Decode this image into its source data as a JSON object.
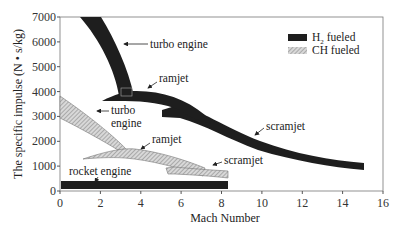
{
  "chart_data": {
    "type": "area",
    "title": "",
    "xlabel": "Mach Number",
    "ylabel": "The specific impulse (N • s/kg)",
    "xlim": [
      0,
      16
    ],
    "ylim": [
      0,
      7000
    ],
    "x_ticks": [
      "0",
      "2",
      "4",
      "6",
      "8",
      "10",
      "12",
      "14",
      "16"
    ],
    "y_ticks": [
      "0",
      "1000",
      "2000",
      "3000",
      "4000",
      "5000",
      "6000",
      "7000"
    ],
    "grid": false,
    "legend_position": "upper right",
    "legend": [
      {
        "label": "H2 fueled",
        "label_main": "H",
        "label_sub": "2",
        "label_rest": " fueled",
        "style": "solid",
        "color": "#1e1e1e"
      },
      {
        "label": "CH fueled",
        "label_main": "CH fueled",
        "style": "hatched",
        "color": "#b5b5b5"
      }
    ],
    "series": [
      {
        "name": "turbo engine",
        "fuel": "H2",
        "x_range": [
          1,
          3.7
        ],
        "isp_upper": [
          7000,
          3800
        ],
        "isp_lower": [
          7000,
          3800
        ],
        "note": "band from Mach ~1-2 at 7000 down to ~3800 near Mach 3-3.7"
      },
      {
        "name": "ramjet",
        "fuel": "H2",
        "x_range": [
          2.1,
          7.5
        ],
        "isp_start": 3600,
        "isp_peak": 4100,
        "isp_end": 2600
      },
      {
        "name": "scramjet",
        "fuel": "H2",
        "x_range": [
          5,
          15
        ],
        "isp_start": [
          3000,
          3400
        ],
        "isp_end": [
          1000,
          1300
        ]
      },
      {
        "name": "turbo engine",
        "fuel": "CH",
        "x_range": [
          0,
          3.6
        ],
        "isp_start": [
          3300,
          4100
        ],
        "isp_end": 1700
      },
      {
        "name": "ramjet",
        "fuel": "CH",
        "x_range": [
          1.1,
          7
        ],
        "isp_start": 1300,
        "isp_peak": 1700,
        "isp_end": 600
      },
      {
        "name": "scramjet",
        "fuel": "CH",
        "x_range": [
          5.2,
          8.3
        ],
        "isp_start": 1000,
        "isp_end": [
          700,
          950
        ]
      },
      {
        "name": "rocket engine",
        "fuel": "H2",
        "x_range": [
          0,
          8.3
        ],
        "isp_range": [
          100,
          450
        ]
      }
    ],
    "annotations": [
      "turbo engine",
      "ramjet",
      "scramjet",
      "turbo engine",
      "ramjet",
      "scramjet",
      "rocket engine"
    ]
  },
  "labels": {
    "h2_turbo": "turbo engine",
    "h2_ramjet": "ramjet",
    "h2_scramjet": "scramjet",
    "ch_turbo_1": "turbo",
    "ch_turbo_2": "engine",
    "ch_ramjet": "ramjet",
    "ch_scramjet": "scramjet",
    "rocket": "rocket engine"
  }
}
